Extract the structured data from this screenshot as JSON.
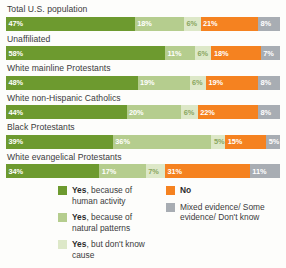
{
  "chart_data": {
    "type": "bar",
    "orientation": "horizontal",
    "stacked": true,
    "normalized_percent": true,
    "title": "",
    "subtitle": "",
    "xlabel": "",
    "ylabel": "",
    "xlim": [
      0,
      100
    ],
    "grid": false,
    "legend_position": "bottom",
    "categories": [
      "Total U.S. population",
      "Unaffiliated",
      "White mainline Protestants",
      "White non-Hispanic Catholics",
      "Black Protestants",
      "White evangelical Protestants"
    ],
    "series": [
      {
        "name": "Yes, because of human activity",
        "color": "#6d9a2f",
        "values": [
          47,
          58,
          48,
          44,
          39,
          34
        ],
        "labels": [
          "47%",
          "58%",
          "48%",
          "44%",
          "39%",
          "34%"
        ]
      },
      {
        "name": "Yes, because of natural patterns",
        "color": "#b5cd8e",
        "values": [
          18,
          11,
          19,
          20,
          36,
          17
        ],
        "labels": [
          "18%",
          "11%",
          "19%",
          "20%",
          "36%",
          "17%"
        ]
      },
      {
        "name": "Yes, but don't know cause",
        "color": "#dde8c8",
        "values": [
          6,
          6,
          6,
          6,
          5,
          7
        ],
        "labels": [
          "6%",
          "6%",
          "6%",
          "6%",
          "5%",
          "7%"
        ]
      },
      {
        "name": "No",
        "color": "#f58220",
        "values": [
          21,
          18,
          19,
          22,
          15,
          31
        ],
        "labels": [
          "21%",
          "18%",
          "19%",
          "22%",
          "15%",
          "31%"
        ]
      },
      {
        "name": "Mixed evidence/ Some evidence/ Don't know",
        "color": "#a8adb3",
        "values": [
          8,
          7,
          8,
          8,
          5,
          11
        ],
        "labels": [
          "8%",
          "7%",
          "8%",
          "8%",
          "5%",
          "11%"
        ]
      }
    ]
  },
  "legend": {
    "columns": [
      {
        "items": [
          {
            "swatch": "#6d9a2f",
            "strong": "Yes",
            "rest": ", because of human activity"
          },
          {
            "swatch": "#b5cd8e",
            "strong": "Yes",
            "rest": ", because of natural patterns"
          },
          {
            "swatch": "#dde8c8",
            "strong": "Yes",
            "rest": ", but don't know cause"
          }
        ]
      },
      {
        "items": [
          {
            "swatch": "#f58220",
            "strong": "No",
            "rest": ""
          },
          {
            "swatch": "#a8adb3",
            "strong": "",
            "rest": "Mixed evidence/ Some evidence/ Don't know"
          }
        ]
      }
    ]
  }
}
